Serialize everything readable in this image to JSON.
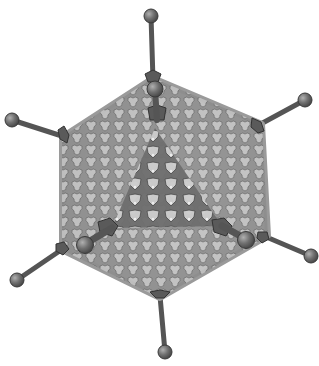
{
  "figure": {
    "caption": "Icosahedral capsid with hexon subunits, penton bases and protruding fiber knobs",
    "colors": {
      "background": "#ffffff",
      "capsid_fill": "#bdbdbd",
      "capsid_dark": "#6a6a6a",
      "hexon_light": "#d4d4d4",
      "outline": "#3a3a3a",
      "fiber": "#5c5c5c",
      "knob": "#707070",
      "knob_highlight": "#a8a8a8"
    },
    "capsid": {
      "vertices": [
        [
          153,
          78
        ],
        [
          262,
          124
        ],
        [
          268,
          236
        ],
        [
          160,
          298
        ],
        [
          62,
          250
        ],
        [
          62,
          137
        ]
      ]
    },
    "fibers": [
      {
        "name": "fiber-top-back",
        "base": [
          153,
          78
        ],
        "knob": [
          151,
          16
        ]
      },
      {
        "name": "fiber-top-front",
        "base": [
          157,
          122
        ],
        "knob": [
          155,
          89
        ]
      },
      {
        "name": "fiber-left",
        "base": [
          65,
          137
        ],
        "knob": [
          12,
          120
        ]
      },
      {
        "name": "fiber-right",
        "base": [
          257,
          126
        ],
        "knob": [
          305,
          100
        ]
      },
      {
        "name": "fiber-lower-left-back",
        "base": [
          64,
          248
        ],
        "knob": [
          17,
          280
        ]
      },
      {
        "name": "fiber-lower-left-front",
        "base": [
          112,
          230
        ],
        "knob": [
          85,
          245
        ]
      },
      {
        "name": "fiber-lower-right-back",
        "base": [
          264,
          236
        ],
        "knob": [
          311,
          256
        ]
      },
      {
        "name": "fiber-lower-right-front",
        "base": [
          222,
          228
        ],
        "knob": [
          246,
          240
        ]
      },
      {
        "name": "fiber-bottom",
        "base": [
          160,
          296
        ],
        "knob": [
          165,
          352
        ]
      }
    ]
  }
}
